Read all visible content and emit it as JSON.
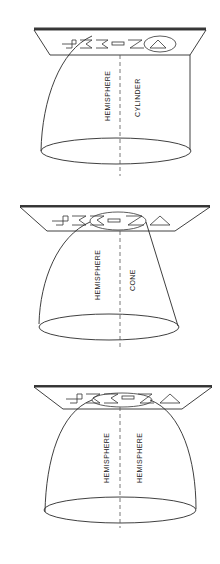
{
  "figure": {
    "panels": [
      {
        "id": "top",
        "left_label": "HEMISPHERE",
        "right_label": "CYLINDER",
        "plate_text": "JAE-ZA"
      },
      {
        "id": "middle",
        "left_label": "HEMISPHERE",
        "right_label": "CONE",
        "plate_text": "JAE-ZA"
      },
      {
        "id": "bottom",
        "left_label": "HEMISPHERE",
        "right_label": "HEMISPHERE",
        "plate_text": "JAE-ZA"
      }
    ],
    "colors": {
      "line": "#2a2a2a",
      "background": "#ffffff"
    }
  }
}
